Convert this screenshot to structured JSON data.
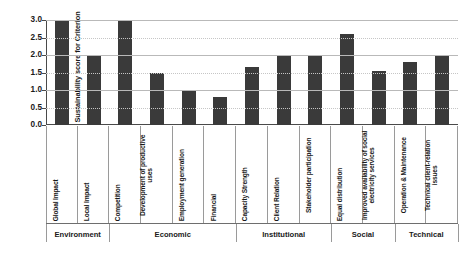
{
  "chart_data": {
    "type": "bar",
    "title": "",
    "xlabel": "",
    "ylabel": "Sustainability score for Criterion",
    "ylim": [
      0,
      3.0
    ],
    "yticks": [
      "3.0",
      "2.5",
      "2.0",
      "1.5",
      "1.0",
      "0.5",
      "0.0"
    ],
    "ytick_values": [
      3.0,
      2.5,
      2.0,
      1.5,
      1.0,
      0.5,
      0.0
    ],
    "grid": true,
    "legend": "none",
    "bar_color": "#3a3a3a",
    "categories": [
      "Global Impact",
      "Local Impact",
      "Competition",
      "Development of productive uses",
      "Employment generation",
      "Financial",
      "Capacity Strength",
      "Client Relation",
      "Stakeholder participation",
      "Equal distribution",
      "Improved availability of social electricity services",
      "Operation & Maintenance",
      "Technical client-relation issues"
    ],
    "values": [
      3.0,
      2.0,
      3.0,
      1.5,
      1.0,
      0.8,
      1.65,
      2.0,
      2.0,
      2.6,
      1.55,
      1.8,
      2.0
    ],
    "groups": [
      {
        "label": "Environment",
        "count": 2
      },
      {
        "label": "Economic",
        "count": 4
      },
      {
        "label": "Institutional",
        "count": 3
      },
      {
        "label": "Social",
        "count": 2
      },
      {
        "label": "Technical",
        "count": 2
      }
    ]
  }
}
